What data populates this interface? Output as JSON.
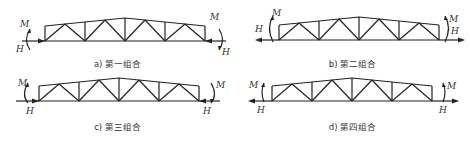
{
  "figure": {
    "panels": [
      {
        "id": "a",
        "caption": "a) 第一组合",
        "left_moment": {
          "label": "M",
          "direction": "left-bulge"
        },
        "left_force": {
          "label": "H",
          "direction": "right"
        },
        "right_moment": {
          "label": "M",
          "direction": "right-bulge"
        },
        "right_force": {
          "label": "H",
          "direction": "left"
        }
      },
      {
        "id": "b",
        "caption": "b) 第二组合",
        "left_moment": {
          "label": "M",
          "direction": "left-bulge"
        },
        "left_force": {
          "label": "H",
          "direction": "left"
        },
        "right_moment": {
          "label": "M",
          "direction": "right-bulge"
        },
        "right_force": {
          "label": "H",
          "direction": "right"
        }
      },
      {
        "id": "c",
        "caption": "c) 第三组合",
        "left_moment": {
          "label": "M",
          "direction": "left-bulge"
        },
        "left_force": {
          "label": "H",
          "direction": "right"
        },
        "right_moment": {
          "label": "M",
          "direction": "right-bulge"
        },
        "right_force": {
          "label": "H",
          "direction": "left"
        }
      },
      {
        "id": "d",
        "caption": "d) 第四组合",
        "left_moment": {
          "label": "M",
          "direction": "left-bulge"
        },
        "left_force": {
          "label": "H",
          "direction": "left"
        },
        "right_moment": {
          "label": "M",
          "direction": "right-bulge"
        },
        "right_force": {
          "label": "H",
          "direction": "right"
        }
      }
    ],
    "line_color": "#222222"
  }
}
